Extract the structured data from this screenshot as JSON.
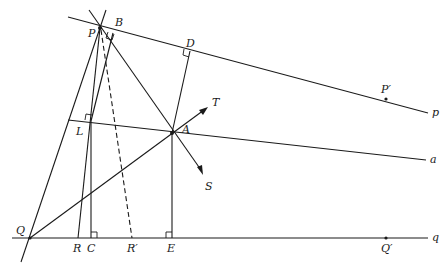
{
  "diagram": {
    "type": "geometry-construction",
    "lines": {
      "p": "p",
      "a": "a",
      "q": "q"
    },
    "points": {
      "P": "P",
      "B": "B",
      "D": "D",
      "A": "A",
      "T": "T",
      "S": "S",
      "L": "L",
      "Q": "Q",
      "R": "R",
      "C": "C",
      "R_prime": "R′",
      "E": "E",
      "Q_prime": "Q′",
      "P_prime": "P′"
    }
  }
}
